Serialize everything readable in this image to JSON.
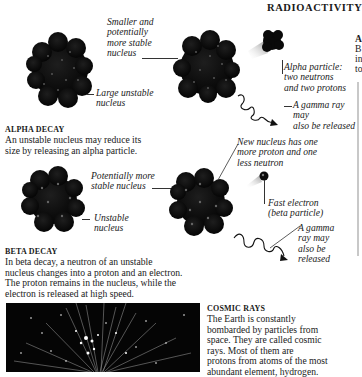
{
  "page": {
    "title": "RADIOACTIVITY"
  },
  "alpha_decay": {
    "heading": "ALPHA DECAY",
    "body_line1": "An unstable nucleus may reduce its",
    "body_line2": "size by releasing an alpha particle.",
    "captions": {
      "smaller_nucleus": [
        "Smaller and",
        "potentially",
        "more stable",
        "nucleus"
      ],
      "large_unstable": [
        "Large unstable",
        "nucleus"
      ],
      "alpha_particle": [
        "Alpha particle:",
        "two neutrons",
        "and two protons"
      ],
      "gamma_ray": [
        "A gamma ray may",
        "also be released"
      ]
    }
  },
  "beta_decay": {
    "heading": "BETA DECAY",
    "body_lines": [
      "In beta decay, a neutron of an unstable",
      "nucleus changes into a proton and an electron.",
      "The proton remains in the nucleus, while the",
      "electron is released at high speed."
    ],
    "captions": {
      "more_stable": [
        "Potentially more",
        "stable nucleus"
      ],
      "unstable": [
        "Unstable",
        "nucleus"
      ],
      "new_nucleus": [
        "New nucleus has one",
        "more proton and one",
        "less neutron"
      ],
      "fast_electron": [
        "Fast electron",
        "(beta particle)"
      ],
      "gamma_ray": [
        "A gamma",
        "ray may",
        "also be",
        "released"
      ]
    }
  },
  "cosmic_rays": {
    "heading": "COSMIC RAYS",
    "body_lines": [
      "The Earth is constantly",
      "bombarded by particles from",
      "space. They are called cosmic",
      "rays. Most of them are",
      "protons from atoms of the most",
      "abundant element, hydrogen."
    ]
  },
  "right_edge": {
    "letters": [
      "A",
      "B",
      "in",
      "to"
    ]
  },
  "colors": {
    "nucleus": "#0a0a0a",
    "text": "#1a1a1a",
    "photo_bg": "#050505"
  }
}
